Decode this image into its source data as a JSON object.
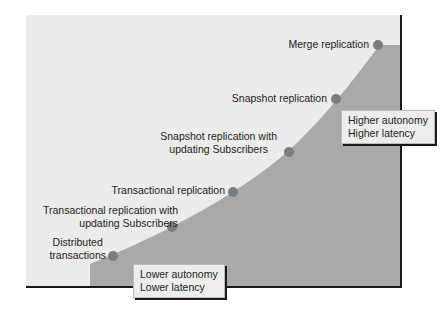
{
  "diagram": {
    "colors": {
      "background": "#ffffff",
      "panel": "#ececec",
      "fill": "#a9a9a9",
      "dot": "#7d7d7d",
      "axis": "#1a1a1a"
    },
    "points": [
      {
        "label_lines": [
          "Distributed",
          "transactions"
        ],
        "x": 113,
        "y": 256
      },
      {
        "label_lines": [
          "Transactional replication with",
          "updating Subscribers"
        ],
        "x": 172,
        "y": 227
      },
      {
        "label_lines": [
          "Transactional replication"
        ],
        "x": 233,
        "y": 192
      },
      {
        "label_lines": [
          "Snapshot replication with",
          "updating Subscribers"
        ],
        "x": 289,
        "y": 152
      },
      {
        "label_lines": [
          "Snapshot replication"
        ],
        "x": 336,
        "y": 99
      },
      {
        "label_lines": [
          "Merge replication"
        ],
        "x": 378,
        "y": 45
      }
    ],
    "high_box": {
      "line1": "Higher autonomy",
      "line2": "Higher latency"
    },
    "low_box": {
      "line1": "Lower autonomy",
      "line2": "Lower latency"
    }
  }
}
